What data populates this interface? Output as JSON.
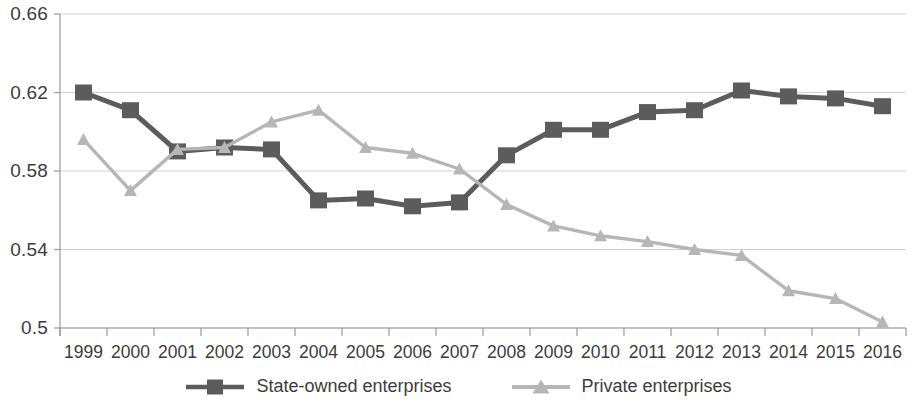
{
  "chart_data": {
    "type": "line",
    "title": "",
    "xlabel": "",
    "ylabel": "",
    "categories": [
      "1999",
      "2000",
      "2001",
      "2002",
      "2003",
      "2004",
      "2005",
      "2006",
      "2007",
      "2008",
      "2009",
      "2010",
      "2011",
      "2012",
      "2013",
      "2014",
      "2015",
      "2016"
    ],
    "ylim": [
      0.5,
      0.66
    ],
    "yticks": [
      0.5,
      0.54,
      0.58,
      0.62,
      0.66
    ],
    "ytick_labels": [
      "0.5",
      "0.54",
      "0.58",
      "0.62",
      "0.66"
    ],
    "grid": true,
    "legend_position": "bottom",
    "series": [
      {
        "name": "State-owned enterprises",
        "color": "#5c5c5c",
        "marker": "square",
        "values": [
          0.62,
          0.611,
          0.59,
          0.592,
          0.591,
          0.565,
          0.566,
          0.562,
          0.564,
          0.588,
          0.601,
          0.601,
          0.61,
          0.611,
          0.621,
          0.618,
          0.617,
          0.613
        ]
      },
      {
        "name": "Private enterprises",
        "color": "#b6b6b6",
        "marker": "triangle",
        "values": [
          0.596,
          0.57,
          0.591,
          0.592,
          0.605,
          0.611,
          0.592,
          0.589,
          0.581,
          0.563,
          0.552,
          0.547,
          0.544,
          0.54,
          0.537,
          0.519,
          0.515,
          0.503
        ]
      }
    ]
  },
  "axis": {
    "ytick_labels": [
      "0.66",
      "0.62",
      "0.58",
      "0.54",
      "0.5"
    ],
    "xtick_labels": [
      "1999",
      "2000",
      "2001",
      "2002",
      "2003",
      "2004",
      "2005",
      "2006",
      "2007",
      "2008",
      "2009",
      "2010",
      "2011",
      "2012",
      "2013",
      "2014",
      "2015",
      "2016"
    ]
  },
  "legend": {
    "items": [
      {
        "label": "State-owned enterprises",
        "color": "#5c5c5c",
        "marker": "square-marker-icon"
      },
      {
        "label": "Private enterprises",
        "color": "#b6b6b6",
        "marker": "triangle-marker-icon"
      }
    ]
  },
  "colors": {
    "state_owned": "#5c5c5c",
    "private": "#b6b6b6",
    "axis": "#9a9a9a",
    "grid": "#d2d2d2",
    "text": "#3c3c3c"
  }
}
